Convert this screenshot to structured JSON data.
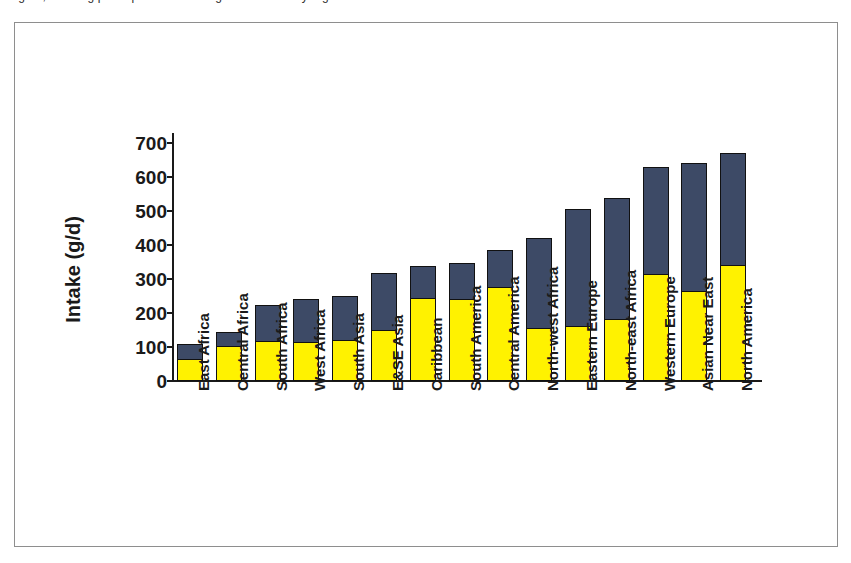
{
  "top_caption": {
    "clipped_line": "Figure, showing per capita fruit and vegetable intake by region"
  },
  "chart_data": {
    "type": "bar",
    "subtype": "stacked-vertical",
    "title": "",
    "xlabel": "",
    "ylabel": "Intake (g/d)",
    "ylim": [
      0,
      700
    ],
    "ytick_step": 100,
    "yticks": [
      0,
      100,
      200,
      300,
      400,
      500,
      600,
      700
    ],
    "grid": false,
    "legend_position": "none",
    "categories": [
      "East Africa",
      "Central Africa",
      "South Africa",
      "West Africa",
      "South Asia",
      "E&SE Asia",
      "Caribbean",
      "South America",
      "Central America",
      "North-west Africa",
      "Eastern Europe",
      "North-east Africa",
      "Western Europe",
      "Asian Near East",
      "North America"
    ],
    "series": [
      {
        "name": "lower-segment",
        "color": "#fff200",
        "values": [
          62,
          100,
          115,
          112,
          118,
          148,
          242,
          237,
          273,
          152,
          160,
          180,
          313,
          262,
          337
        ]
      },
      {
        "name": "upper-segment",
        "color": "#3d4a66",
        "values": [
          48,
          45,
          110,
          128,
          132,
          170,
          95,
          111,
          112,
          268,
          345,
          358,
          317,
          378,
          335
        ]
      }
    ],
    "totals": [
      110,
      145,
      225,
      240,
      250,
      318,
      337,
      348,
      385,
      420,
      505,
      538,
      630,
      640,
      672
    ]
  },
  "colors": {
    "lower_segment": "#fff200",
    "upper_segment": "#3d4a66",
    "axis": "#1a1a1a",
    "frame": "#8e8e8e",
    "background": "#ffffff"
  }
}
